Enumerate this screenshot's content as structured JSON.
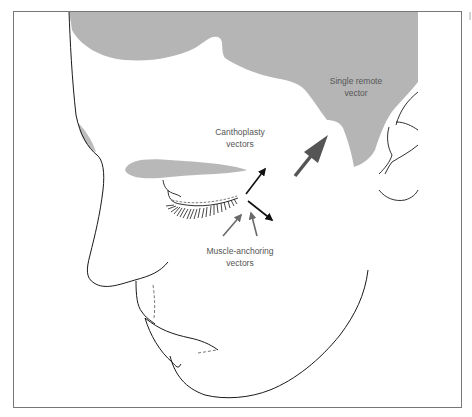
{
  "figure": {
    "colors": {
      "frame": "#777777",
      "outline": "#1a1a1a",
      "hair_fill": "#b5b5b5",
      "brow_fill": "#b8b8b8",
      "black_arrow": "#111111",
      "gray_arrow": "#6a6a6a",
      "remote_arrow": "#555555",
      "label_text": "#555555"
    }
  },
  "labels": {
    "single_remote_vector": {
      "line1": "Single remote",
      "line2": "vector"
    },
    "canthoplasty_vectors": {
      "line1": "Canthoplasty",
      "line2": "vectors"
    },
    "muscle_anchoring_vectors": {
      "line1": "Muscle-anchoring",
      "line2": "vectors"
    }
  },
  "arrows": [
    {
      "name": "canthoplasty-vector-up",
      "color": "black"
    },
    {
      "name": "canthoplasty-vector-down",
      "color": "black"
    },
    {
      "name": "muscle-anchoring-vector-left",
      "color": "gray"
    },
    {
      "name": "muscle-anchoring-vector-right",
      "color": "gray"
    },
    {
      "name": "single-remote-vector",
      "color": "dark-gray"
    }
  ]
}
